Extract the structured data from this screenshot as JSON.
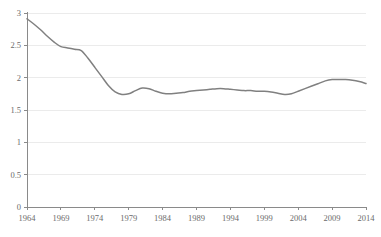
{
  "chart_data": {
    "type": "line",
    "title": "",
    "xlabel": "",
    "ylabel": "",
    "xlim": [
      1964,
      2014
    ],
    "ylim": [
      0,
      3
    ],
    "grid": true,
    "legend": null,
    "line_color": "#808080",
    "grid_color": "#e6e6e6",
    "axis_color": "#8a8a8a",
    "label_color": "#6b6b6b",
    "x_ticks": [
      1964,
      1969,
      1974,
      1979,
      1984,
      1989,
      1994,
      1999,
      2004,
      2009,
      2014
    ],
    "x_tick_labels": [
      "1964",
      "1969",
      "1974",
      "1979",
      "1984",
      "1989",
      "1994",
      "1999",
      "2004",
      "2009",
      "2014"
    ],
    "y_ticks": [
      0,
      0.5,
      1,
      1.5,
      2,
      2.5,
      3
    ],
    "y_tick_labels": [
      "0",
      "0.5",
      "1",
      "1.5",
      "2",
      "2.5",
      "3"
    ],
    "series": [
      {
        "name": "series-1",
        "color": "#808080",
        "x": [
          1964,
          1965,
          1966,
          1967,
          1968,
          1969,
          1970,
          1971,
          1972,
          1973,
          1974,
          1975,
          1976,
          1977,
          1978,
          1979,
          1980,
          1981,
          1982,
          1983,
          1984,
          1985,
          1986,
          1987,
          1988,
          1989,
          1990,
          1991,
          1992,
          1993,
          1994,
          1995,
          1996,
          1997,
          1998,
          1999,
          2000,
          2001,
          2002,
          2003,
          2004,
          2005,
          2006,
          2007,
          2008,
          2009,
          2010,
          2011,
          2012,
          2013,
          2014
        ],
        "values": [
          2.91,
          2.83,
          2.74,
          2.64,
          2.55,
          2.48,
          2.46,
          2.44,
          2.42,
          2.3,
          2.16,
          2.02,
          1.88,
          1.78,
          1.74,
          1.75,
          1.8,
          1.84,
          1.83,
          1.79,
          1.76,
          1.75,
          1.76,
          1.77,
          1.79,
          1.8,
          1.81,
          1.82,
          1.83,
          1.83,
          1.82,
          1.81,
          1.8,
          1.8,
          1.79,
          1.79,
          1.78,
          1.76,
          1.74,
          1.75,
          1.79,
          1.83,
          1.87,
          1.91,
          1.95,
          1.97,
          1.97,
          1.97,
          1.96,
          1.94,
          1.91
        ]
      }
    ]
  },
  "plot_geometry": {
    "left": 27,
    "right": 366,
    "top": 13,
    "bottom": 207
  }
}
